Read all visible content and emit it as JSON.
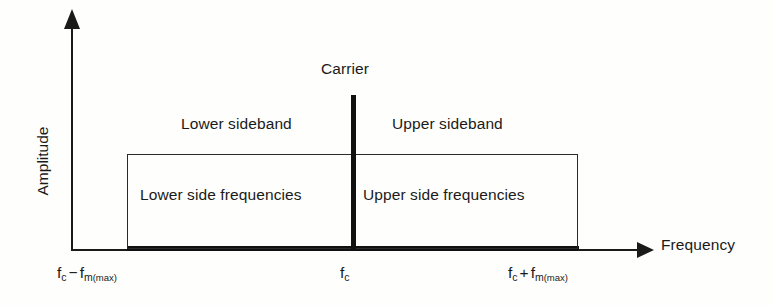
{
  "figure": {
    "type": "am-spectrum-diagram",
    "background_color": "#fefefc",
    "ink_color": "#1a1a1a"
  },
  "axes": {
    "y_label": "Amplitude",
    "x_label": "Frequency",
    "y_arrow_icon": "arrow-up-icon",
    "x_arrow_icon": "arrow-right-icon"
  },
  "carrier": {
    "label": "Carrier"
  },
  "sidebands": [
    {
      "name": "lower",
      "band_label": "Lower sideband",
      "frequencies_label": "Lower side frequencies"
    },
    {
      "name": "upper",
      "band_label": "Upper sideband",
      "frequencies_label": "Upper side frequencies"
    }
  ],
  "ticks": {
    "left": {
      "base": "f",
      "base_sub": "c",
      "operator": "−",
      "term_base": "f",
      "term_sub": "m",
      "term_paren": "(max)",
      "full_text": "f₀ − fₘ(max)"
    },
    "center": {
      "base": "f",
      "base_sub": "c",
      "full_text": "fₘ"
    },
    "right": {
      "base": "f",
      "base_sub": "c",
      "operator": "+",
      "term_base": "f",
      "term_sub": "m",
      "term_paren": "(max)",
      "full_text": "f₀ + fₘ(max)"
    }
  },
  "chart_data": {
    "type": "bar",
    "title": "",
    "xlabel": "Frequency",
    "ylabel": "Amplitude",
    "categories": [
      "f_c - f_m(max)",
      "f_c",
      "f_c + f_m(max)"
    ],
    "annotations": [
      "Carrier",
      "Lower sideband",
      "Upper sideband",
      "Lower side frequencies",
      "Upper side frequencies"
    ],
    "grid": false,
    "legend": "none"
  }
}
